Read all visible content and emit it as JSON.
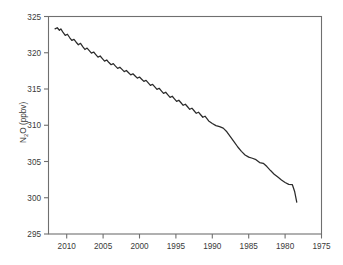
{
  "chart_data": {
    "type": "line",
    "title": "",
    "xlabel": "",
    "ylabel": "N2O (ppbv)",
    "ylabel_parts": {
      "pre": "N",
      "sub": "2",
      "post": "O (ppbv)"
    },
    "xlim": [
      2012.5,
      1975.0
    ],
    "ylim": [
      295,
      325
    ],
    "x_reversed": true,
    "grid": false,
    "legend": null,
    "xticks": [
      2010,
      2005,
      2000,
      1995,
      1990,
      1985,
      1980,
      1975
    ],
    "xtick_labels": [
      "2010",
      "2005",
      "2000",
      "1995",
      "1990",
      "1985",
      "1980",
      "1975"
    ],
    "yticks": [
      295,
      300,
      305,
      310,
      315,
      320,
      325
    ],
    "ytick_labels": [
      "295",
      "300",
      "305",
      "310",
      "315",
      "320",
      "325"
    ],
    "line_color": "#2b2b2b",
    "frame_color": "#6f6f6f",
    "background_color": "#ffffff",
    "series": [
      {
        "name": "N2O mole fraction",
        "x": [
          2011.6,
          2011.3,
          2011.0,
          2010.8,
          2010.5,
          2010.2,
          2009.9,
          2009.6,
          2009.3,
          2009.0,
          2008.7,
          2008.4,
          2008.1,
          2007.8,
          2007.5,
          2007.2,
          2006.9,
          2006.6,
          2006.3,
          2006.0,
          2005.7,
          2005.4,
          2005.1,
          2004.8,
          2004.5,
          2004.2,
          2003.9,
          2003.6,
          2003.3,
          2003.0,
          2002.7,
          2002.4,
          2002.1,
          2001.8,
          2001.5,
          2001.2,
          2000.9,
          2000.6,
          2000.3,
          2000.0,
          1999.7,
          1999.4,
          1999.1,
          1998.8,
          1998.5,
          1998.2,
          1997.9,
          1997.6,
          1997.3,
          1997.0,
          1996.7,
          1996.4,
          1996.1,
          1995.8,
          1995.5,
          1995.2,
          1994.9,
          1994.6,
          1994.3,
          1994.0,
          1993.7,
          1993.4,
          1993.1,
          1992.8,
          1992.5,
          1992.2,
          1991.9,
          1991.6,
          1991.3,
          1991.0,
          1990.5,
          1990.0,
          1989.5,
          1989.0,
          1988.5,
          1988.0,
          1987.5,
          1987.0,
          1986.5,
          1986.0,
          1985.5,
          1985.0,
          1984.5,
          1984.0,
          1983.5,
          1983.0,
          1982.5,
          1982.0,
          1981.5,
          1981.0,
          1980.5,
          1980.0,
          1979.5,
          1979.0,
          1978.7,
          1978.4
        ],
        "y": [
          323.3,
          323.45,
          323.1,
          323.3,
          322.8,
          322.4,
          322.55,
          322.1,
          321.7,
          321.85,
          321.45,
          321.1,
          321.3,
          320.85,
          320.45,
          320.65,
          320.3,
          319.95,
          320.1,
          319.75,
          319.4,
          319.55,
          319.2,
          318.85,
          319.0,
          318.65,
          318.35,
          318.5,
          318.15,
          317.85,
          318.0,
          317.7,
          317.4,
          317.55,
          317.25,
          316.95,
          317.1,
          316.8,
          316.5,
          316.65,
          316.35,
          316.05,
          316.2,
          315.85,
          315.5,
          315.65,
          315.3,
          314.95,
          315.1,
          314.75,
          314.4,
          314.55,
          314.2,
          313.85,
          314.0,
          313.65,
          313.3,
          313.45,
          313.1,
          312.75,
          312.9,
          312.55,
          312.2,
          312.35,
          312.0,
          311.65,
          311.8,
          311.45,
          311.1,
          311.25,
          310.6,
          310.25,
          309.95,
          309.8,
          309.6,
          309.1,
          308.4,
          307.7,
          307.0,
          306.4,
          305.9,
          305.6,
          305.45,
          305.25,
          304.85,
          304.75,
          304.3,
          303.75,
          303.25,
          302.85,
          302.45,
          302.1,
          301.85,
          301.8,
          300.9,
          299.4
        ]
      }
    ],
    "annotations": []
  }
}
